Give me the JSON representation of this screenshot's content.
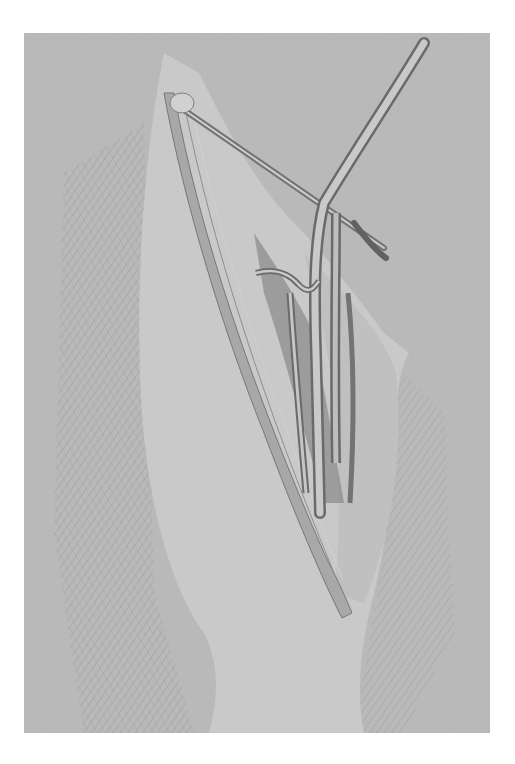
{
  "illustration": {
    "subject": "pencil drawing of anterior thigh showing femoral triangle with vessels and sartorius muscle",
    "colors": {
      "page": "#ffffff",
      "paper": "#b9b9b9",
      "light": "#d4d4d4",
      "shade": "#8a8a8a",
      "dark": "#5a5a5a"
    }
  }
}
